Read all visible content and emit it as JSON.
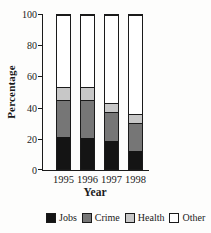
{
  "figure": {
    "background": "#fdfdfc",
    "axis_color": "#1a1a1a"
  },
  "chart_data": {
    "type": "bar",
    "stacked": true,
    "title": "",
    "xlabel": "Year",
    "ylabel": "Percentage",
    "categories": [
      "1995",
      "1996",
      "1997",
      "1998"
    ],
    "series": [
      {
        "name": "Jobs",
        "color": "#141414",
        "values": [
          21,
          20,
          18,
          12
        ]
      },
      {
        "name": "Crime",
        "color": "#767676",
        "values": [
          24,
          25,
          19,
          18
        ]
      },
      {
        "name": "Health",
        "color": "#c7c7c7",
        "values": [
          8,
          8,
          6,
          6
        ]
      },
      {
        "name": "Other",
        "color": "#ffffff",
        "values": [
          47,
          47,
          57,
          64
        ]
      }
    ],
    "ylim": [
      0,
      100
    ],
    "yticks": [
      0,
      20,
      40,
      60,
      80,
      100
    ],
    "grid": false,
    "legend_position": "bottom"
  }
}
